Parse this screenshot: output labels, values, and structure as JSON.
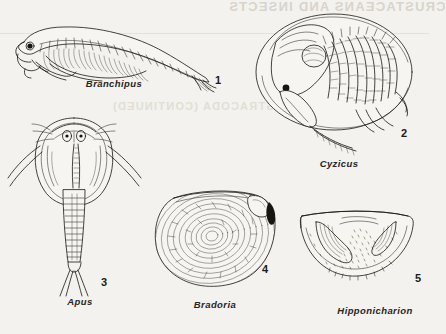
{
  "page": {
    "kind": "book-plate",
    "background_color": "#f4f2ee",
    "ink_color": "#17150f",
    "bleed_through": {
      "header_text": "CRUSTACEANS AND INSECTS",
      "subheader_text": "OSTRACODA (CONTINUED)",
      "color": "#d8d4cc",
      "note": "mirror-reversed show-through from the reverse side of the page"
    },
    "rule_color": "#e6e2da"
  },
  "figures": [
    {
      "number": "1",
      "name": "Branchipus",
      "subject": "fairy shrimp, lateral view with segmented trunk, paired phyllopod limbs and forked tail",
      "number_pos": {
        "x": 215,
        "y": 66
      },
      "caption_pos": {
        "x": 114,
        "y": 83
      }
    },
    {
      "number": "2",
      "name": "Cyzicus",
      "subject": "clam shrimp in bivalved carapace with protruding head, trunk limbs and antennae",
      "number_pos": {
        "x": 401,
        "y": 127
      },
      "caption_pos": {
        "x": 339,
        "y": 163
      }
    },
    {
      "number": "3",
      "name": "Apus",
      "subject": "tadpole shrimp, dorsal view with shield carapace, paired eyes and long caudal cercopods",
      "number_pos": {
        "x": 101,
        "y": 276
      },
      "caption_pos": {
        "x": 80,
        "y": 301
      }
    },
    {
      "number": "4",
      "name": "Bradoria",
      "subject": "bradoriid arthropod valve with concentric growth lines and anterodorsal node",
      "number_pos": {
        "x": 262,
        "y": 269
      },
      "caption_pos": {
        "x": 215,
        "y": 304
      }
    },
    {
      "number": "5",
      "name": "Hipponicharion",
      "subject": "ostracod valve, semicircular outline with lobate ridges and punctate surface",
      "number_pos": {
        "x": 415,
        "y": 272
      },
      "caption_pos": {
        "x": 375,
        "y": 310
      }
    }
  ]
}
